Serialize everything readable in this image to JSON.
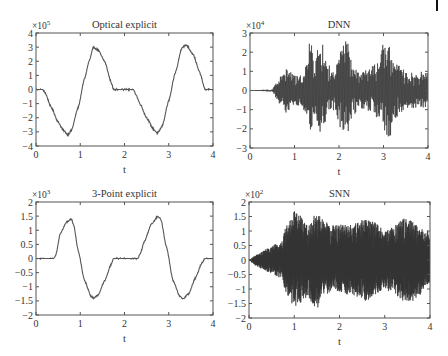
{
  "figure": {
    "background": "#ffffff",
    "axis_color": "#555555",
    "line_color": "#555555",
    "dense_color": "#333333"
  },
  "chart_data": [
    {
      "id": "optical",
      "type": "line",
      "title": "Optical explicit",
      "xlabel": "t",
      "ylabel": "",
      "exponent_label": "×10",
      "exponent": "5",
      "xlim": [
        0,
        4
      ],
      "ylim": [
        -4,
        4
      ],
      "xticks": [
        0,
        1,
        2,
        3,
        4
      ],
      "xtick_labels": [
        "0",
        "1",
        "2",
        "3",
        "4"
      ],
      "yticks": [
        -4,
        -3,
        -2,
        -1,
        0,
        1,
        2,
        3,
        4
      ],
      "ytick_labels": [
        "-4",
        "-3",
        "-2",
        "-1",
        "0",
        "1",
        "2",
        "3",
        "4"
      ],
      "grid": false,
      "signal": "smooth",
      "x": [
        0,
        0.15,
        0.2,
        0.35,
        0.5,
        0.62,
        0.72,
        0.8,
        0.95,
        1.1,
        1.2,
        1.3,
        1.4,
        1.55,
        1.7,
        1.75,
        2.0,
        2.2,
        2.25,
        2.35,
        2.5,
        2.65,
        2.75,
        2.85,
        3.0,
        3.15,
        3.3,
        3.4,
        3.55,
        3.7,
        3.82,
        3.9,
        4.0
      ],
      "y": [
        0,
        0,
        -0.2,
        -1.3,
        -2.3,
        -2.9,
        -3.2,
        -2.9,
        -1.3,
        0.8,
        2.0,
        3.0,
        2.8,
        2.0,
        0.5,
        0,
        0,
        0,
        -0.3,
        -1.0,
        -2.0,
        -2.8,
        -3.1,
        -2.6,
        -0.8,
        1.2,
        3.0,
        3.15,
        2.5,
        1.2,
        0,
        0,
        0
      ],
      "noise": 0.06
    },
    {
      "id": "dnn",
      "type": "line",
      "title": "DNN",
      "xlabel": "t",
      "ylabel": "",
      "exponent_label": "×10",
      "exponent": "4",
      "xlim": [
        0,
        4
      ],
      "ylim": [
        -3,
        3
      ],
      "xticks": [
        0,
        1,
        2,
        3,
        4
      ],
      "xtick_labels": [
        "0",
        "1",
        "2",
        "3",
        "4"
      ],
      "yticks": [
        -3,
        -2,
        -1,
        0,
        1,
        2,
        3
      ],
      "ytick_labels": [
        "-3",
        "-2",
        "-1",
        "0",
        "1",
        "2",
        "3"
      ],
      "grid": false,
      "signal": "oscillation",
      "envelope_t": [
        0,
        0.5,
        0.55,
        0.7,
        0.85,
        0.95,
        1.1,
        1.3,
        1.35,
        1.45,
        1.6,
        1.75,
        1.9,
        2.05,
        2.1,
        2.2,
        2.3,
        2.5,
        2.7,
        2.9,
        3.0,
        3.05,
        3.15,
        3.2,
        3.35,
        3.5,
        3.7,
        3.9,
        4.0
      ],
      "envelope_pos": [
        0.02,
        0.05,
        0.3,
        0.8,
        1.2,
        0.9,
        0.7,
        1.6,
        2.8,
        1.8,
        2.6,
        1.4,
        1.0,
        2.2,
        2.6,
        2.6,
        1.2,
        1.0,
        1.2,
        1.6,
        2.5,
        2.2,
        2.6,
        1.8,
        1.3,
        1.0,
        0.9,
        1.0,
        1.1
      ],
      "envelope_neg": [
        -0.02,
        -0.05,
        -0.3,
        -0.8,
        -1.3,
        -0.8,
        -0.8,
        -1.6,
        -2.1,
        -1.5,
        -2.3,
        -1.3,
        -1.0,
        -2.1,
        -2.3,
        -2.3,
        -1.3,
        -1.0,
        -1.1,
        -1.6,
        -2.5,
        -2.3,
        -2.5,
        -1.7,
        -1.3,
        -1.0,
        -0.9,
        -0.9,
        -1.0
      ],
      "cycles_per_unit": 60
    },
    {
      "id": "three_point",
      "type": "line",
      "title": "3-Point explicit",
      "xlabel": "t",
      "ylabel": "",
      "exponent_label": "×10",
      "exponent": "3",
      "xlim": [
        0,
        4
      ],
      "ylim": [
        -2,
        2
      ],
      "xticks": [
        0,
        1,
        2,
        3,
        4
      ],
      "xtick_labels": [
        "0",
        "1",
        "2",
        "3",
        "4"
      ],
      "yticks": [
        -2,
        -1.5,
        -1,
        -0.5,
        0,
        0.5,
        1,
        1.5,
        2
      ],
      "ytick_labels": [
        "-2",
        "-1.5",
        "-1",
        "-0.5",
        "0",
        "0.5",
        "1",
        "1.5",
        "2"
      ],
      "grid": false,
      "signal": "smooth",
      "x": [
        0,
        0.4,
        0.45,
        0.55,
        0.7,
        0.8,
        0.85,
        0.95,
        1.1,
        1.25,
        1.3,
        1.4,
        1.55,
        1.7,
        1.75,
        2.0,
        2.3,
        2.35,
        2.45,
        2.6,
        2.75,
        2.82,
        2.95,
        3.1,
        3.25,
        3.32,
        3.45,
        3.6,
        3.75,
        3.82,
        4.0
      ],
      "y": [
        0,
        0,
        0.15,
        0.9,
        1.3,
        1.4,
        1.2,
        0.3,
        -0.8,
        -1.35,
        -1.4,
        -1.3,
        -0.8,
        -0.2,
        0,
        0,
        0,
        0.15,
        0.6,
        1.2,
        1.48,
        1.4,
        0.4,
        -0.8,
        -1.35,
        -1.42,
        -1.25,
        -0.7,
        -0.15,
        0,
        0
      ],
      "noise": 0.025
    },
    {
      "id": "snn",
      "type": "line",
      "title": "SNN",
      "xlabel": "t",
      "ylabel": "",
      "exponent_label": "×10",
      "exponent": "2",
      "xlim": [
        0,
        4
      ],
      "ylim": [
        -2,
        2
      ],
      "xticks": [
        0,
        1,
        2,
        3,
        4
      ],
      "xtick_labels": [
        "0",
        "1",
        "2",
        "3",
        "4"
      ],
      "yticks": [
        -2,
        -1.5,
        -1,
        -0.5,
        0,
        0.5,
        1,
        1.5,
        2
      ],
      "ytick_labels": [
        "-2",
        "-1.5",
        "-1",
        "-0.5",
        "0",
        "0.5",
        "1",
        "1.5",
        "2"
      ],
      "grid": false,
      "signal": "oscillation",
      "envelope_t": [
        0,
        0.2,
        0.4,
        0.6,
        0.75,
        0.8,
        0.95,
        1.0,
        1.1,
        1.3,
        1.5,
        1.6,
        1.8,
        2.0,
        2.2,
        2.4,
        2.6,
        2.8,
        3.0,
        3.2,
        3.4,
        3.6,
        3.8,
        4.0
      ],
      "envelope_pos": [
        0.02,
        0.2,
        0.4,
        0.55,
        0.7,
        1.2,
        1.4,
        1.7,
        1.6,
        1.2,
        1.65,
        1.5,
        1.2,
        1.25,
        1.2,
        1.3,
        1.5,
        1.3,
        1.0,
        1.2,
        1.45,
        1.35,
        1.1,
        1.0
      ],
      "envelope_neg": [
        -0.02,
        -0.25,
        -0.4,
        -0.55,
        -0.7,
        -1.1,
        -1.5,
        -1.75,
        -1.5,
        -1.3,
        -1.75,
        -1.4,
        -1.1,
        -1.1,
        -1.2,
        -1.3,
        -1.45,
        -1.2,
        -1.0,
        -1.2,
        -1.4,
        -1.45,
        -1.2,
        -1.0
      ],
      "cycles_per_unit": 160
    }
  ]
}
